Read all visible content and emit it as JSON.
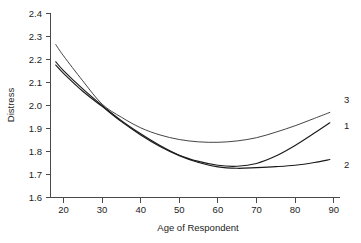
{
  "chart_data": {
    "type": "line",
    "title": "",
    "xlabel": "Age of Respondent",
    "ylabel": "Distress",
    "xlim": [
      16.5,
      91.5
    ],
    "ylim": [
      1.555,
      2.44
    ],
    "xticks": [
      20,
      30,
      40,
      50,
      60,
      70,
      80,
      90
    ],
    "xtick_labels": [
      "20",
      "30",
      "40",
      "50",
      "60",
      "70",
      "80",
      "90"
    ],
    "yticks": [
      1.6,
      1.7,
      1.8,
      1.9,
      2.0,
      2.1,
      2.2,
      2.3,
      2.4
    ],
    "ytick_labels": [
      "1.6",
      "1.7",
      "1.8",
      "1.9",
      "2.0",
      "2.1",
      "2.2",
      "2.3",
      "2.4"
    ],
    "grid": false,
    "legend_position": "right-of-curve-ends",
    "x": [
      18,
      20,
      25,
      30,
      35,
      40,
      45,
      50,
      55,
      60,
      65,
      70,
      75,
      80,
      85,
      89
    ],
    "series": [
      {
        "name": "1",
        "label": "1",
        "values": [
          2.19,
          2.152,
          2.072,
          2.0,
          1.934,
          1.877,
          1.826,
          1.784,
          1.757,
          1.74,
          1.736,
          1.748,
          1.78,
          1.826,
          1.88,
          1.925
        ]
      },
      {
        "name": "2",
        "label": "2",
        "values": [
          2.176,
          2.14,
          2.062,
          1.996,
          1.93,
          1.872,
          1.822,
          1.782,
          1.752,
          1.733,
          1.727,
          1.73,
          1.734,
          1.74,
          1.752,
          1.765
        ]
      },
      {
        "name": "3",
        "label": "3",
        "values": [
          2.265,
          2.216,
          2.107,
          2.006,
          1.949,
          1.903,
          1.872,
          1.852,
          1.842,
          1.84,
          1.846,
          1.86,
          1.884,
          1.912,
          1.944,
          1.97
        ]
      }
    ],
    "annotations": [
      {
        "text": "3",
        "x": 90.5,
        "y": 2.012
      },
      {
        "text": "1",
        "x": 90.5,
        "y": 1.9
      },
      {
        "text": "2",
        "x": 90.5,
        "y": 1.733
      }
    ]
  }
}
